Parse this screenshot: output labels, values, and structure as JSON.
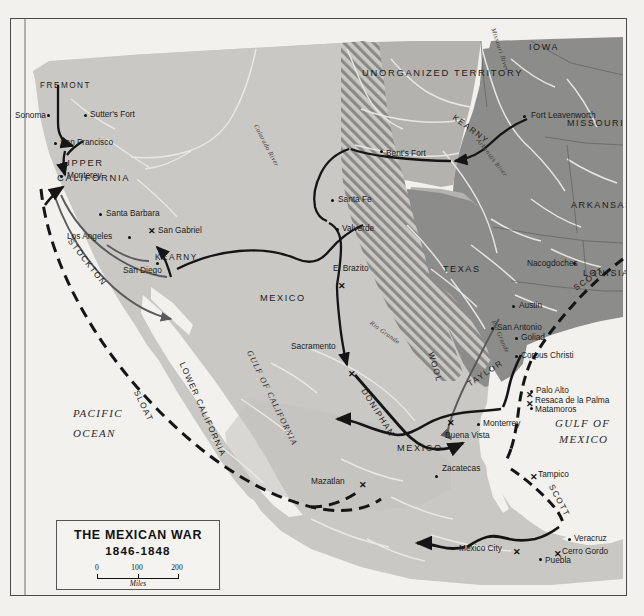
{
  "map": {
    "title": "THE MEXICAN WAR",
    "years": "1846-1848",
    "scale": {
      "ticks": [
        "0",
        "100",
        "200"
      ],
      "units": "Miles"
    },
    "colors": {
      "ocean": "#f2f1ee",
      "mexico": "#c9c8c4",
      "us_states": "#8c8c8a",
      "unorganized": "#b3b2ae",
      "disputed_hatch": "#8f8e8b",
      "route_land": "#151515",
      "route_sea": "#151515",
      "frame": "#4a4a4a"
    },
    "regions": [
      {
        "name": "UPPER CALIFORNIA",
        "type": "territory"
      },
      {
        "name": "UNORGANIZED TERRITORY",
        "type": "territory"
      },
      {
        "name": "IOWA",
        "type": "state"
      },
      {
        "name": "MISSOURI",
        "type": "state"
      },
      {
        "name": "ARKANSAS",
        "type": "state"
      },
      {
        "name": "LOUISIANA",
        "type": "state"
      },
      {
        "name": "TEXAS",
        "type": "state"
      },
      {
        "name": "MEXICO",
        "type": "country"
      },
      {
        "name": "LOWER CALIFORNIA",
        "type": "territory"
      }
    ],
    "water_labels": [
      {
        "name": "PACIFIC OCEAN",
        "lines": [
          "PACIFIC",
          "OCEAN"
        ]
      },
      {
        "name": "GULF OF MEXICO",
        "lines": [
          "GULF OF",
          "MEXICO"
        ]
      },
      {
        "name": "GULF OF CALIFORNIA"
      }
    ],
    "rivers": [
      "Colorado River",
      "Missouri River",
      "Arkansas River",
      "Rio Grande",
      "Rio Grande"
    ],
    "cities": [
      {
        "name": "Sonoma"
      },
      {
        "name": "Sutter's Fort"
      },
      {
        "name": "San Francisco"
      },
      {
        "name": "Monterey"
      },
      {
        "name": "Santa Barbara"
      },
      {
        "name": "Los Angeles"
      },
      {
        "name": "San Gabriel"
      },
      {
        "name": "San Diego"
      },
      {
        "name": "Fort Leavenworth"
      },
      {
        "name": "Bent's Fort"
      },
      {
        "name": "Santa Fe"
      },
      {
        "name": "Valverde"
      },
      {
        "name": "El Brazito"
      },
      {
        "name": "Sacramento"
      },
      {
        "name": "Nacogdoches"
      },
      {
        "name": "Austin"
      },
      {
        "name": "San Antonio"
      },
      {
        "name": "Goliad"
      },
      {
        "name": "Corpus Christi"
      },
      {
        "name": "Palo Alto"
      },
      {
        "name": "Resaca de la Palma"
      },
      {
        "name": "Matamoros"
      },
      {
        "name": "Monterrey"
      },
      {
        "name": "Buena Vista"
      },
      {
        "name": "Zacatecas"
      },
      {
        "name": "Mazatlan"
      },
      {
        "name": "Tampico"
      },
      {
        "name": "Veracruz"
      },
      {
        "name": "Cerro Gordo"
      },
      {
        "name": "Puebla"
      },
      {
        "name": "Mexico City"
      }
    ],
    "routes": [
      {
        "name": "FREMONT",
        "kind": "land"
      },
      {
        "name": "STOCKTON",
        "kind": "land"
      },
      {
        "name": "KEARNY",
        "kind": "land"
      },
      {
        "name": "KEARNY",
        "kind": "land"
      },
      {
        "name": "DONIPHAN",
        "kind": "land"
      },
      {
        "name": "WOOL",
        "kind": "land"
      },
      {
        "name": "TAYLOR",
        "kind": "land"
      },
      {
        "name": "SCOTT",
        "kind": "sea"
      },
      {
        "name": "SCOTT",
        "kind": "sea"
      },
      {
        "name": "SLOAT",
        "kind": "sea"
      }
    ],
    "battles": [
      "San Gabriel",
      "El Brazito",
      "Sacramento",
      "Palo Alto",
      "Resaca de la Palma",
      "Buena Vista",
      "Mazatlan",
      "Tampico",
      "Cerro Gordo",
      "Mexico City"
    ],
    "labels": {
      "upper_california": [
        "UPPER",
        "CALIFORNIA"
      ],
      "unorganized_territory": "UNORGANIZED TERRITORY",
      "iowa": "IOWA",
      "missouri": "MISSOURI",
      "arkansas": "ARKANSAS",
      "louisiana": "LOUISIANA",
      "texas": "TEXAS",
      "mexico_north": "MEXICO",
      "mexico_south": "MEXICO",
      "lower_california": "LOWER CALIFORNIA",
      "pacific_1": "PACIFIC",
      "pacific_2": "OCEAN",
      "gulf_mexico_1": "GULF OF",
      "gulf_mexico_2": "MEXICO",
      "gulf_california": "GULF OF CALIFORNIA",
      "colorado_river": "Colorado River",
      "missouri_river": "Missouri River",
      "arkansas_river": "Arkansas River",
      "rio_grande_1": "Rio Grande",
      "rio_grande_2": "Rio Grande",
      "fremont": "FREMONT",
      "stockton": "STOCKTON",
      "kearny_1": "KEARNY",
      "kearny_2": "KEARNY",
      "doniphan": "DONIPHAN",
      "wool_1": "WOOL",
      "wool_2": "WOOL",
      "taylor": "TAYLOR",
      "scott_1": "SCOTT",
      "scott_2": "SCOTT",
      "sloat": "SLOAT",
      "sonoma": "Sonoma",
      "sutters_fort": "Sutter's Fort",
      "san_francisco": "San Francisco",
      "monterey": "Monterey",
      "santa_barbara": "Santa Barbara",
      "los_angeles": "Los Angeles",
      "san_gabriel": "San Gabriel",
      "san_diego": "San Diego",
      "fort_leavenworth": "Fort Leavenworth",
      "bents_fort": "Bent's Fort",
      "santa_fe": "Santa Fe",
      "valverde": "Valverde",
      "el_brazito": "El Brazito",
      "sacramento": "Sacramento",
      "nacogdoches": "Nacogdoches",
      "austin": "Austin",
      "san_antonio": "San Antonio",
      "goliad": "Goliad",
      "corpus_christi": "Corpus Christi",
      "palo_alto": "Palo Alto",
      "resaca": "Resaca de la Palma",
      "matamoros": "Matamoros",
      "monterrey": "Monterrey",
      "buena_vista": "Buena Vista",
      "zacatecas": "Zacatecas",
      "mazatlan": "Mazatlan",
      "tampico": "Tampico",
      "veracruz": "Veracruz",
      "cerro_gordo": "Cerro Gordo",
      "puebla": "Puebla",
      "mexico_city": "Mexico City"
    }
  }
}
